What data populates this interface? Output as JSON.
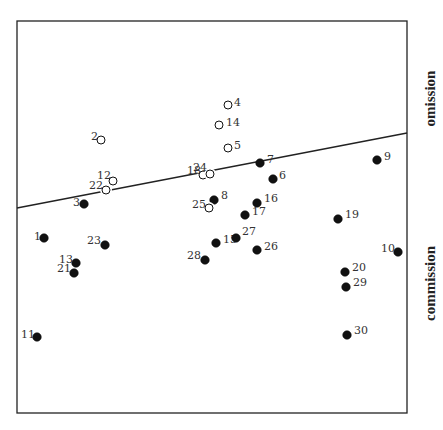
{
  "labels": {
    "top": "omission",
    "bottom": "commission"
  },
  "chart_data": {
    "type": "scatter",
    "title": "",
    "xlabel": "",
    "ylabel": "",
    "region_labels": [
      "omission",
      "commission"
    ],
    "frame_px": {
      "left": 17,
      "top": 21,
      "right": 407,
      "bottom": 413
    },
    "divider_line_px": {
      "x1": 17,
      "y1": 208,
      "x2": 407,
      "y2": 133
    },
    "legend": {
      "open": "omission (above line)",
      "filled": "commission (below line)"
    },
    "points": [
      {
        "id": "1",
        "x": 44,
        "y": 238,
        "filled": true,
        "lx": -10,
        "ly": -2
      },
      {
        "id": "2",
        "x": 101,
        "y": 140,
        "filled": false,
        "lx": -10,
        "ly": -4
      },
      {
        "id": "3",
        "x": 84,
        "y": 204,
        "filled": true,
        "lx": -11,
        "ly": -2
      },
      {
        "id": "4",
        "x": 228,
        "y": 105,
        "filled": false,
        "lx": 6,
        "ly": -3
      },
      {
        "id": "5",
        "x": 228,
        "y": 148,
        "filled": false,
        "lx": 6,
        "ly": -3
      },
      {
        "id": "6",
        "x": 273,
        "y": 179,
        "filled": true,
        "lx": 6,
        "ly": -4
      },
      {
        "id": "7",
        "x": 260,
        "y": 163,
        "filled": true,
        "lx": 7,
        "ly": -4
      },
      {
        "id": "8",
        "x": 214,
        "y": 200,
        "filled": true,
        "lx": 7,
        "ly": -5
      },
      {
        "id": "9",
        "x": 377,
        "y": 160,
        "filled": true,
        "lx": 7,
        "ly": -4
      },
      {
        "id": "10",
        "x": 398,
        "y": 252,
        "filled": true,
        "lx": -17,
        "ly": -4
      },
      {
        "id": "11",
        "x": 37,
        "y": 337,
        "filled": true,
        "lx": -16,
        "ly": -3
      },
      {
        "id": "12",
        "x": 113,
        "y": 181,
        "filled": false,
        "lx": -16,
        "ly": -6
      },
      {
        "id": "13",
        "x": 76,
        "y": 263,
        "filled": true,
        "lx": -17,
        "ly": -4
      },
      {
        "id": "14",
        "x": 219,
        "y": 125,
        "filled": false,
        "lx": 7,
        "ly": -3
      },
      {
        "id": "15",
        "x": 216,
        "y": 243,
        "filled": true,
        "lx": 7,
        "ly": -4
      },
      {
        "id": "16",
        "x": 257,
        "y": 203,
        "filled": true,
        "lx": 7,
        "ly": -5
      },
      {
        "id": "17",
        "x": 245,
        "y": 215,
        "filled": true,
        "lx": 7,
        "ly": -4
      },
      {
        "id": "18",
        "x": 203,
        "y": 175,
        "filled": false,
        "lx": -16,
        "ly": -5
      },
      {
        "id": "19",
        "x": 338,
        "y": 219,
        "filled": true,
        "lx": 7,
        "ly": -5
      },
      {
        "id": "20",
        "x": 345,
        "y": 272,
        "filled": true,
        "lx": 7,
        "ly": -5
      },
      {
        "id": "21",
        "x": 74,
        "y": 273,
        "filled": true,
        "lx": -17,
        "ly": -5
      },
      {
        "id": "22",
        "x": 106,
        "y": 190,
        "filled": false,
        "lx": -17,
        "ly": -5
      },
      {
        "id": "23",
        "x": 105,
        "y": 245,
        "filled": true,
        "lx": -18,
        "ly": -5
      },
      {
        "id": "24",
        "x": 210,
        "y": 174,
        "filled": false,
        "lx": -17,
        "ly": -7
      },
      {
        "id": "25",
        "x": 209,
        "y": 208,
        "filled": false,
        "lx": -17,
        "ly": -4
      },
      {
        "id": "26",
        "x": 257,
        "y": 250,
        "filled": true,
        "lx": 7,
        "ly": -4
      },
      {
        "id": "27",
        "x": 236,
        "y": 238,
        "filled": true,
        "lx": 6,
        "ly": -7
      },
      {
        "id": "28",
        "x": 205,
        "y": 260,
        "filled": true,
        "lx": -18,
        "ly": -5
      },
      {
        "id": "29",
        "x": 346,
        "y": 287,
        "filled": true,
        "lx": 7,
        "ly": -5
      },
      {
        "id": "30",
        "x": 347,
        "y": 335,
        "filled": true,
        "lx": 7,
        "ly": -5
      }
    ]
  }
}
